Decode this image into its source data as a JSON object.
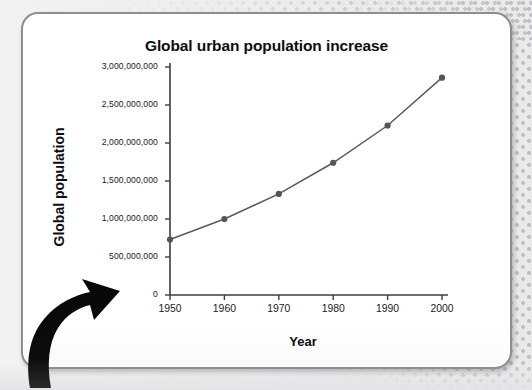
{
  "slide": {
    "title": "Global urban population increase",
    "decoration": {
      "arrow_icon": "curved-up-right-arrow",
      "background_pattern": "halftone-dots"
    }
  },
  "chart_data": {
    "type": "line",
    "title": "Global urban population increase",
    "xlabel": "Year",
    "ylabel": "Global population",
    "x": [
      1950,
      1960,
      1970,
      1980,
      1990,
      2000
    ],
    "xtick_labels": [
      "1950",
      "1960",
      "1970",
      "1980",
      "1990",
      "2000"
    ],
    "values": [
      730000000,
      1000000000,
      1330000000,
      1740000000,
      2230000000,
      2860000000
    ],
    "ytick_values": [
      0,
      500000000,
      1000000000,
      1500000000,
      2000000000,
      2500000000,
      3000000000
    ],
    "ytick_labels": [
      "0",
      "500,000,000",
      "1,000,000,000",
      "1,500,000,000",
      "2,000,000,000",
      "2,500,000,000",
      "3,000,000,000"
    ],
    "xlim": [
      1950,
      2000
    ],
    "ylim": [
      0,
      3000000000
    ],
    "grid": false,
    "legend": "none",
    "series_color": "#5a5a5a",
    "marker": "circle",
    "marker_color": "#555555",
    "axis_color": "#3d3d3d"
  },
  "colors": {
    "slide_background": "#ffffff",
    "slide_border": "#8e8e90",
    "page_background": "#ececed",
    "text": "#0d0d0d",
    "arrow": "#0a0a0a"
  }
}
